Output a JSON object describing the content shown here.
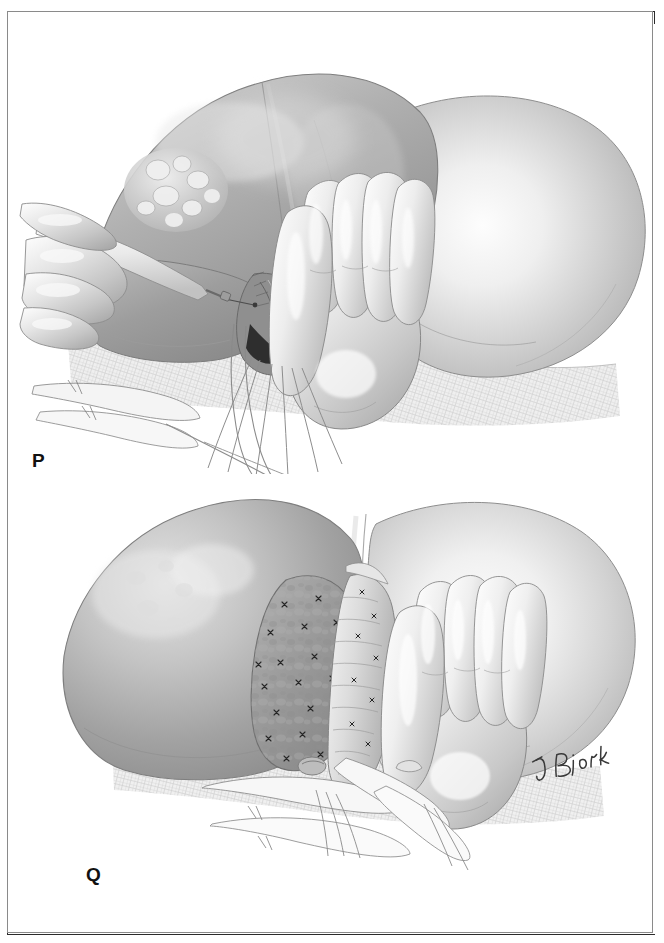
{
  "figure": {
    "kind": "surgical-illustration-plate",
    "medium": "graphite and airbrush grayscale medical illustration",
    "panel_count": 2,
    "background_color": "#ffffff",
    "frame_color": "#2b2b2b",
    "ink_color": "#111111"
  },
  "panels": [
    {
      "id": "P",
      "label": "P",
      "caption_letter": "P",
      "description": "Surgeon's gloved left hand retracts and compresses the liver while an electrocautery/dissector held in the right hand divides the hepatic parenchyma along the demarcation line. A tumor-bearing nodular segment is seen at upper left; vascular pedicles, tapes and suction tubing emerge at the inferior field over laparotomy gauze.",
      "elements": [
        "liver-dome",
        "tumor-nodules",
        "falciform-ligament",
        "electrocautery-dissector",
        "gloved-right-hand-holding-instrument",
        "gloved-left-hand-retracting-liver",
        "hepatic-pedicle",
        "vascular-tapes",
        "suction-tubing",
        "right-liver-lobe",
        "laparotomy-gauze"
      ]
    },
    {
      "id": "Q",
      "label": "Q",
      "caption_letter": "Q",
      "description": "Completed transection. The raw cut surface of the remnant liver is exposed, studded with numerous small suture ligatures securing divided vessels and bile ductules. The gloved hand still supports the remnant; drains and tapes exit inferiorly across the gauze-covered field.",
      "elements": [
        "remnant-liver-lobe",
        "cut-parenchymal-surface",
        "suture-ligatures",
        "divided-vascular-pedicle",
        "gloved-hand-retracting",
        "surgical-drains",
        "vascular-tapes",
        "right-liver-lobe",
        "laparotomy-gauze"
      ]
    }
  ],
  "signature": {
    "present": true,
    "text": "J Bjork",
    "location": "lower right of panel Q",
    "style": "handwritten artist signature"
  },
  "palette": {
    "paper": "#ffffff",
    "frame": "#2b2b2b",
    "label_text": "#111111",
    "organ_light": "#e9e9e9",
    "organ_mid": "#b9b9b9",
    "organ_dark": "#8a8a8a",
    "organ_shadow": "#6a6a6a",
    "glove_highlight": "#f6f6f6",
    "glove_mid": "#d4d4d4",
    "cut_surface": "#9b9b9b",
    "suture": "#2a2a2a",
    "gauze": "#d8d8d8",
    "line": "#5b5b5b"
  }
}
